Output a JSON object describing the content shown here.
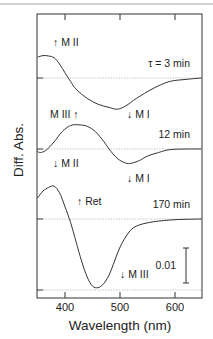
{
  "chart_data": {
    "type": "line",
    "title": "",
    "xlabel": "Wavelength (nm)",
    "ylabel": "Diff. Abs.",
    "xlim": [
      349,
      649
    ],
    "x_ticks": [
      400,
      500,
      600
    ],
    "x_tick_labels": [
      "400",
      "500",
      "600"
    ],
    "grid": false,
    "legend": null,
    "offset_traces": true,
    "scale_bar": {
      "label": "0.01",
      "value": 0.01
    },
    "series": [
      {
        "name": "τ = 3 min",
        "baseline_offset": 0.02,
        "x": [
          350,
          360,
          370,
          380,
          390,
          400,
          410,
          420,
          440,
          460,
          480,
          495,
          510,
          530,
          560,
          590,
          620,
          648
        ],
        "y": [
          0.006,
          0.0064,
          0.0063,
          0.0058,
          0.004,
          0.0015,
          -0.001,
          -0.0032,
          -0.0058,
          -0.0075,
          -0.0084,
          -0.0089,
          -0.008,
          -0.0058,
          -0.003,
          -0.001,
          -0.0004,
          0.0
        ],
        "annotations": [
          {
            "text": "↑ M II",
            "x": 380
          },
          {
            "text": "↓ M I",
            "x": 500
          }
        ]
      },
      {
        "name": "12 min",
        "baseline_offset": 0.0,
        "x": [
          350,
          355,
          365,
          380,
          395,
          410,
          425,
          440,
          455,
          470,
          480,
          495,
          510,
          520,
          535,
          550,
          570,
          590,
          620,
          648
        ],
        "y": [
          -0.0007,
          -0.001,
          -0.0004,
          0.002,
          0.005,
          0.0067,
          0.0069,
          0.0065,
          0.005,
          0.0022,
          0.0,
          -0.0027,
          -0.004,
          -0.0041,
          -0.0033,
          -0.002,
          -0.001,
          -0.0002,
          0.0,
          0.0
        ],
        "annotations": [
          {
            "text": "M III ↑",
            "x": 400
          },
          {
            "text": "↓ M I",
            "x": 500
          },
          {
            "text": "↓ M II",
            "x": 375
          },
          {
            "text": "↓ M I",
            "x": 520
          }
        ]
      },
      {
        "name": "170 min",
        "baseline_offset": -0.02,
        "x": [
          350,
          360,
          370,
          380,
          390,
          400,
          410,
          420,
          430,
          440,
          450,
          460,
          470,
          480,
          490,
          500,
          515,
          530,
          560,
          600,
          648
        ],
        "y": [
          0.006,
          0.008,
          0.009,
          0.0094,
          0.0075,
          0.0035,
          -0.001,
          -0.0065,
          -0.012,
          -0.0165,
          -0.0192,
          -0.0196,
          -0.0185,
          -0.016,
          -0.012,
          -0.008,
          -0.004,
          -0.002,
          -0.0008,
          -0.0002,
          0.0
        ],
        "annotations": [
          {
            "text": "↑ Ret",
            "x": 410
          },
          {
            "text": "↓ M III",
            "x": 530
          }
        ]
      }
    ]
  },
  "labels": {
    "y_axis": "Diff. Abs.",
    "x_axis": "Wavelength (nm)",
    "tick_400": "400",
    "tick_500": "500",
    "tick_600": "600",
    "trace1_time": "τ = 3 min",
    "trace2_time": "12 min",
    "trace3_time": "170 min",
    "ann_mii_up": "↑ M II",
    "ann_mi_down_1": "↓ M I",
    "ann_miii_up": "M III ↑",
    "ann_mii_down": "↓ M II",
    "ann_mi_down_2": "↓ M I",
    "ann_ret_up": "↑ Ret",
    "ann_miii_down": "↓ M III",
    "scale_bar_label": "0.01"
  }
}
